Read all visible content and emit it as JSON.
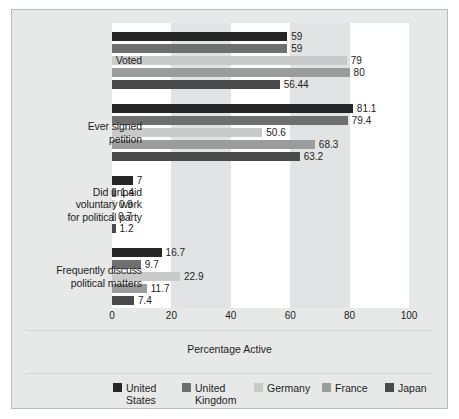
{
  "chart": {
    "type": "bar",
    "orientation": "horizontal",
    "xlabel": "Percentage Active",
    "ylabel": "",
    "title": "",
    "xlim": [
      0,
      100
    ],
    "xticks": [
      "0",
      "20",
      "40",
      "60",
      "80",
      "100"
    ],
    "grid": "alternating vertical bands every 20 units",
    "legend_position": "bottom"
  },
  "chart_data": {
    "type": "bar",
    "title": "",
    "xlabel": "Percentage Active",
    "ylabel": "",
    "xlim": [
      0,
      100
    ],
    "xticks": [
      0,
      20,
      40,
      60,
      80,
      100
    ],
    "orientation": "horizontal",
    "grid": true,
    "legend_position": "bottom",
    "categories": [
      "Voted",
      "Ever signed petition",
      "Did unpaid voluntary work for political party",
      "Frequently discuss political matters"
    ],
    "series": [
      {
        "name": "United States",
        "color": "#262626",
        "values": [
          59,
          81.1,
          7,
          16.7
        ]
      },
      {
        "name": "United Kingdom",
        "color": "#6e6f6f",
        "values": [
          59,
          79.4,
          1.4,
          9.7
        ]
      },
      {
        "name": "Germany",
        "color": "#c9caca",
        "values": [
          79,
          50.6,
          0.9,
          22.9
        ]
      },
      {
        "name": "France",
        "color": "#9b9c9c",
        "values": [
          80,
          68.3,
          0.7,
          11.7
        ]
      },
      {
        "name": "Japan",
        "color": "#4a4a4a",
        "values": [
          56.44,
          63.2,
          1.2,
          7.4
        ]
      }
    ]
  },
  "categories": [
    {
      "label": "Voted",
      "lines": [
        "Voted"
      ],
      "bars": [
        {
          "series": "United States",
          "value": 59,
          "label": "59"
        },
        {
          "series": "United Kingdom",
          "value": 59,
          "label": "59"
        },
        {
          "series": "Germany",
          "value": 79,
          "label": "79"
        },
        {
          "series": "France",
          "value": 80,
          "label": "80"
        },
        {
          "series": "Japan",
          "value": 56.44,
          "label": "56.44"
        }
      ]
    },
    {
      "label": "Ever signed petition",
      "lines": [
        "Ever signed",
        "petition"
      ],
      "bars": [
        {
          "series": "United States",
          "value": 81.1,
          "label": "81.1"
        },
        {
          "series": "United Kingdom",
          "value": 79.4,
          "label": "79.4"
        },
        {
          "series": "Germany",
          "value": 50.6,
          "label": "50.6"
        },
        {
          "series": "France",
          "value": 68.3,
          "label": "68.3"
        },
        {
          "series": "Japan",
          "value": 63.2,
          "label": "63.2"
        }
      ]
    },
    {
      "label": "Did unpaid voluntary work for political party",
      "lines": [
        "Did unpaid",
        "voluntary work",
        "for political party"
      ],
      "bars": [
        {
          "series": "United States",
          "value": 7,
          "label": "7"
        },
        {
          "series": "United Kingdom",
          "value": 1.4,
          "label": "1.4"
        },
        {
          "series": "Germany",
          "value": 0.9,
          "label": "0.9"
        },
        {
          "series": "France",
          "value": 0.7,
          "label": "0.7"
        },
        {
          "series": "Japan",
          "value": 1.2,
          "label": "1.2"
        }
      ]
    },
    {
      "label": "Frequently discuss political matters",
      "lines": [
        "Frequently discuss",
        "political matters"
      ],
      "bars": [
        {
          "series": "United States",
          "value": 16.7,
          "label": "16.7"
        },
        {
          "series": "United Kingdom",
          "value": 9.7,
          "label": "9.7"
        },
        {
          "series": "Germany",
          "value": 22.9,
          "label": "22.9"
        },
        {
          "series": "France",
          "value": 11.7,
          "label": "11.7"
        },
        {
          "series": "Japan",
          "value": 7.4,
          "label": "7.4"
        }
      ]
    }
  ],
  "legend": [
    {
      "name": "United States",
      "lines": "United\nStates",
      "color": "#262626"
    },
    {
      "name": "United Kingdom",
      "lines": "United\nKingdom",
      "color": "#6e6f6f"
    },
    {
      "name": "Germany",
      "lines": "Germany",
      "color": "#c9caca"
    },
    {
      "name": "France",
      "lines": "France",
      "color": "#9b9c9c"
    },
    {
      "name": "Japan",
      "lines": "Japan",
      "color": "#4a4a4a"
    }
  ],
  "colors": {
    "background": "#e7e8e8",
    "plot_background": "#ffffff",
    "band": "#e2e3e4",
    "border": "#b9bbbb",
    "text": "#1d1d1d"
  }
}
